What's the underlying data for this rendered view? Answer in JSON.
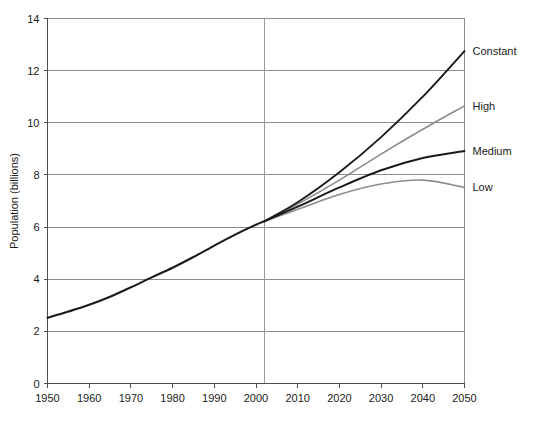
{
  "chart_data": {
    "type": "line",
    "title": "",
    "xlabel": "",
    "ylabel": "Population (billions)",
    "xlim": [
      1950,
      2050
    ],
    "ylim": [
      0,
      14
    ],
    "ytick_values": [
      0,
      2,
      4,
      6,
      8,
      10,
      12,
      14
    ],
    "ytick_labels": [
      "0",
      "2",
      "4",
      "6",
      "8",
      "10",
      "12",
      "14"
    ],
    "xtick_values": [
      1950,
      1960,
      1970,
      1980,
      1990,
      2000,
      2010,
      2020,
      2030,
      2040,
      2050
    ],
    "xtick_labels": [
      "1950",
      "1960",
      "1970",
      "1980",
      "1990",
      "2000",
      "2010",
      "2020",
      "2030",
      "2040",
      "2050"
    ],
    "grid": "horizontal",
    "legend_position": "right-inline",
    "projection_divider_x": 2002,
    "history": {
      "name": "Estimates",
      "color": "#1a1a1a",
      "x": [
        1950,
        1955,
        1960,
        1965,
        1970,
        1975,
        1980,
        1985,
        1990,
        1995,
        2000,
        2002
      ],
      "values": [
        2.52,
        2.76,
        3.02,
        3.33,
        3.69,
        4.07,
        4.44,
        4.85,
        5.29,
        5.71,
        6.09,
        6.22
      ]
    },
    "series": [
      {
        "name": "Constant",
        "color": "#1a1a1a",
        "x": [
          2002,
          2010,
          2020,
          2030,
          2040,
          2050
        ],
        "values": [
          6.22,
          6.95,
          8.1,
          9.45,
          11.0,
          12.75
        ]
      },
      {
        "name": "High",
        "color": "#8c8c8c",
        "x": [
          2002,
          2010,
          2020,
          2030,
          2040,
          2050
        ],
        "values": [
          6.22,
          6.88,
          7.8,
          8.8,
          9.75,
          10.65
        ]
      },
      {
        "name": "Medium",
        "color": "#1a1a1a",
        "x": [
          2002,
          2010,
          2020,
          2030,
          2040,
          2050
        ],
        "values": [
          6.22,
          6.78,
          7.52,
          8.18,
          8.65,
          8.92
        ]
      },
      {
        "name": "Low",
        "color": "#8c8c8c",
        "x": [
          2002,
          2010,
          2020,
          2030,
          2040,
          2050
        ],
        "values": [
          6.22,
          6.68,
          7.25,
          7.65,
          7.8,
          7.52
        ]
      }
    ],
    "colors": {
      "axis": "#4d4d4d",
      "grid": "#8c8c8c",
      "divider": "#9a9a9a",
      "dark_series": "#1a1a1a",
      "gray_series": "#8c8c8c",
      "background": "#ffffff"
    }
  }
}
